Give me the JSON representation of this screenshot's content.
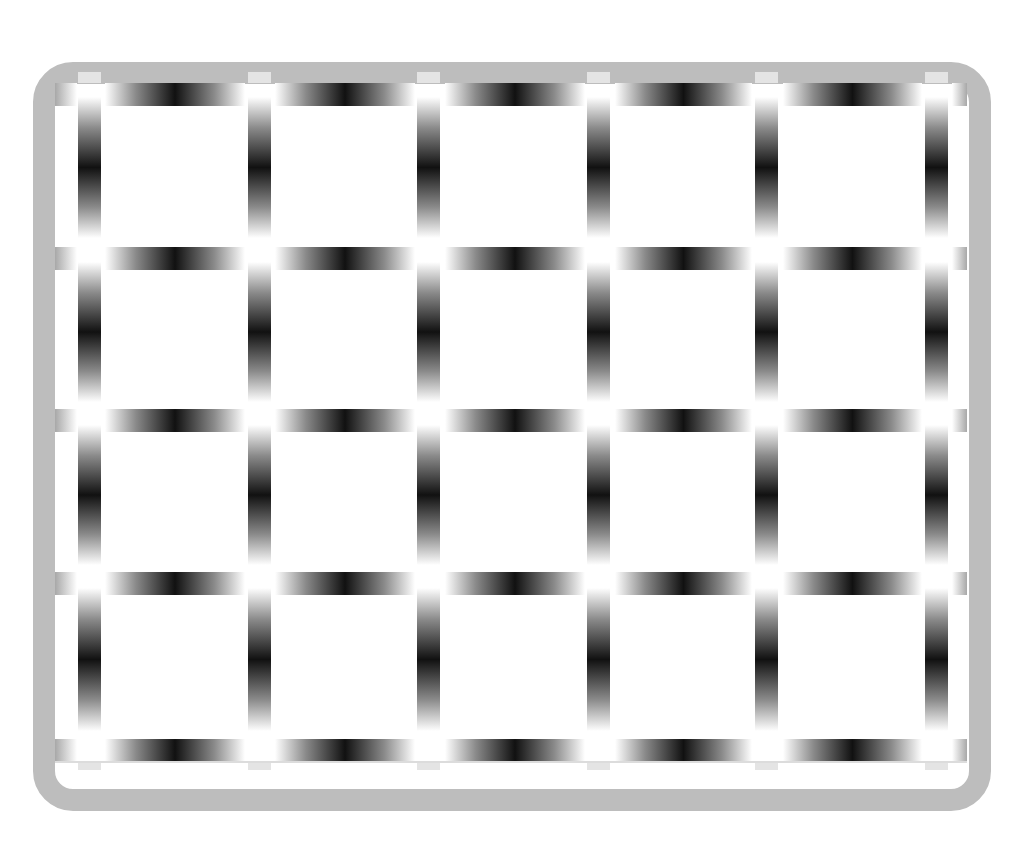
{
  "figure": {
    "frame_color": "#bdbdbd",
    "bar_dark_color": "#111111",
    "bar_light_color": "#ffffff",
    "columns": [
      55,
      105,
      275,
      445,
      615,
      783,
      952
    ],
    "column_ends": [
      77,
      245,
      415,
      585,
      752,
      922,
      967
    ],
    "vbar_x": [
      78,
      248,
      417,
      587,
      755,
      925
    ],
    "hbar_y": [
      83,
      247,
      409,
      572,
      739
    ],
    "vbar_y_ranges": [
      [
        97,
        238
      ],
      [
        262,
        402
      ],
      [
        425,
        565
      ],
      [
        588,
        731
      ]
    ]
  }
}
